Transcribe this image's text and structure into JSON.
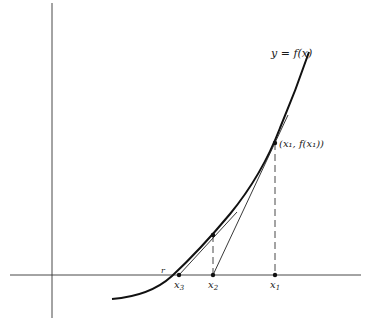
{
  "diagram": {
    "curve_label": "y = f(x)",
    "point_label": "(x₁, f(x₁))",
    "root_label": "r",
    "x_labels": [
      {
        "id": "x1",
        "text": "x",
        "sub": "1"
      },
      {
        "id": "x2",
        "text": "x",
        "sub": "2"
      },
      {
        "id": "x3",
        "text": "x",
        "sub": "3"
      }
    ],
    "colors": {
      "ink": "#1a1a1a",
      "background": "#ffffff"
    }
  }
}
